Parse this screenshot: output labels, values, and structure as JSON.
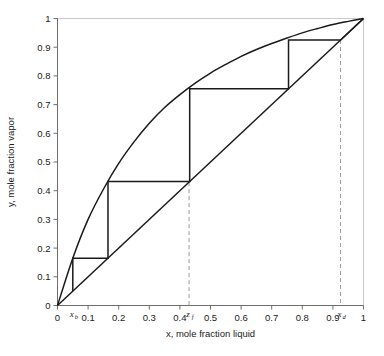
{
  "figure": {
    "caption": ""
  },
  "chart_data": {
    "type": "line",
    "title": "",
    "xlabel": "x, mole fraction liquid",
    "ylabel": "y, mole fraction vapor",
    "xlim": [
      0,
      1
    ],
    "ylim": [
      0,
      1
    ],
    "grid": false,
    "legend_position": "none",
    "xticks": [
      "0",
      "0.1",
      "0.2",
      "0.3",
      "0.4",
      "0.5",
      "0.6",
      "0.7",
      "0.8",
      "0.9",
      "1"
    ],
    "xtick_values": [
      0,
      0.1,
      0.2,
      0.3,
      0.4,
      0.5,
      0.6,
      0.7,
      0.8,
      0.9,
      1
    ],
    "yticks": [
      "0",
      "0.1",
      "0.2",
      "0.3",
      "0.4",
      "0.5",
      "0.6",
      "0.7",
      "0.8",
      "0.9",
      "1"
    ],
    "ytick_values": [
      0,
      0.1,
      0.2,
      0.3,
      0.4,
      0.5,
      0.6,
      0.7,
      0.8,
      0.9,
      1
    ],
    "series": [
      {
        "name": "equilibrium-curve",
        "kind": "curve",
        "x": [
          0,
          0.05,
          0.1,
          0.15,
          0.2,
          0.25,
          0.3,
          0.35,
          0.4,
          0.45,
          0.5,
          0.55,
          0.6,
          0.65,
          0.7,
          0.75,
          0.8,
          0.85,
          0.9,
          0.95,
          1
        ],
        "y": [
          0,
          0.165,
          0.3,
          0.405,
          0.495,
          0.57,
          0.635,
          0.69,
          0.735,
          0.775,
          0.81,
          0.84,
          0.868,
          0.892,
          0.913,
          0.932,
          0.95,
          0.965,
          0.979,
          0.99,
          1
        ]
      },
      {
        "name": "45-degree-line",
        "kind": "line",
        "x": [
          0,
          1
        ],
        "y": [
          0,
          1
        ]
      }
    ],
    "annotations": [
      {
        "name": "xb",
        "label": "x",
        "subscript": "b",
        "x": 0.05,
        "y": 0
      },
      {
        "name": "zf",
        "label": "z",
        "subscript": "f",
        "x": 0.43,
        "y": 0
      },
      {
        "name": "xd",
        "label": "x",
        "subscript": "d",
        "x": 0.925,
        "y": 0
      }
    ],
    "dashed_verticals": [
      {
        "name": "zf-dashed-line",
        "x": 0.43,
        "y_top": 0.43
      },
      {
        "name": "xd-dashed-line",
        "x": 0.925,
        "y_top": 0.925
      }
    ],
    "stages": {
      "name": "stepping-staircase",
      "description": "McCabe-Thiele stages stepped between equilibrium curve and 45-degree operating line",
      "points": [
        {
          "x": 0.05,
          "y": 0.05
        },
        {
          "x": 0.05,
          "y": 0.165
        },
        {
          "x": 0.165,
          "y": 0.165
        },
        {
          "x": 0.165,
          "y": 0.432
        },
        {
          "x": 0.432,
          "y": 0.432
        },
        {
          "x": 0.432,
          "y": 0.755
        },
        {
          "x": 0.755,
          "y": 0.755
        },
        {
          "x": 0.755,
          "y": 0.925
        },
        {
          "x": 0.925,
          "y": 0.925
        },
        {
          "x": 1.0,
          "y": 1.0
        }
      ]
    },
    "colors": {
      "curve": "#1a1a1a",
      "operating_line": "#1a1a1a",
      "stages": "#1a1a1a",
      "dashed": "#9a9a9a",
      "axis": "#8c8c8c",
      "frame": "#c8c8c8",
      "text": "#1a1a1a"
    }
  }
}
